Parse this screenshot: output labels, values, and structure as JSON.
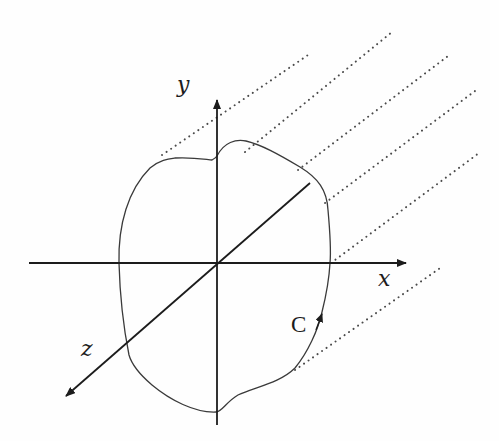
{
  "diagram": {
    "title": "",
    "axes": {
      "x": {
        "label": "x"
      },
      "y": {
        "label": "y"
      },
      "z": {
        "label": "z"
      }
    },
    "curve": {
      "label": "C",
      "orientation": "counterclockwise arrow on right side"
    },
    "projection_lines": {
      "count": 6,
      "style": "dotted",
      "direction": "upper-right"
    },
    "colors": {
      "ink": "#1c1c1c",
      "curve": "#3a3a3a",
      "dots": "#4a4a4a",
      "background": "#fefefe"
    }
  }
}
